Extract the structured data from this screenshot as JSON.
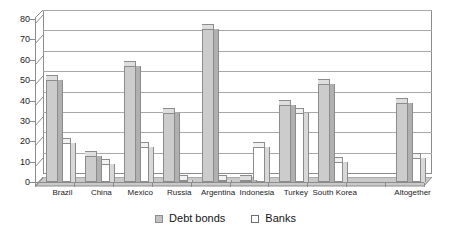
{
  "chart_data": {
    "type": "bar",
    "title": "",
    "subtitle": "",
    "xlabel": "",
    "ylabel": "",
    "ylim": [
      0,
      80
    ],
    "yticks": [
      0,
      10,
      20,
      30,
      40,
      50,
      60,
      70,
      80
    ],
    "ytick_labels": [
      "0",
      "10",
      "20",
      "30",
      "40",
      "50",
      "60",
      "70",
      "80"
    ],
    "grid": true,
    "legend_position": "bottom-center",
    "style": "3d-column",
    "categories": [
      "Brazil",
      "China",
      "Mexico",
      "Russia",
      "Argentina",
      "Indonesia",
      "Turkey",
      "South Korea",
      "Altogether"
    ],
    "series": [
      {
        "name": "Debt bonds",
        "color": "#cccccc",
        "values": [
          50,
          13,
          57,
          34,
          75,
          1,
          38,
          48,
          39
        ]
      },
      {
        "name": "Banks",
        "color": "#ffffff",
        "values": [
          19,
          9,
          17,
          1,
          1,
          17,
          34,
          10,
          12
        ]
      }
    ]
  },
  "legend": {
    "items": [
      {
        "label": "Debt bonds",
        "swatch": "filled-gray-square"
      },
      {
        "label": "Banks",
        "swatch": "outlined-white-square"
      }
    ]
  },
  "axes": {
    "y_tick_labels": [
      "80",
      "70",
      "60",
      "50",
      "40",
      "30",
      "20",
      "10",
      "0"
    ],
    "x_tick_labels": [
      "Brazil",
      "China",
      "Mexico",
      "Russia",
      "Argentina",
      "Indonesia",
      "Turkey",
      "South Korea",
      "Altogether"
    ]
  },
  "colors": {
    "debt_bonds": "#cccccc",
    "banks": "#ffffff",
    "axis": "#8c8c8c",
    "gridline": "#a8a8a8",
    "text": "#1a1a1a",
    "background": "#ffffff"
  }
}
